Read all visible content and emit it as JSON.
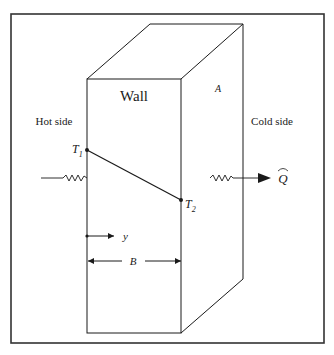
{
  "diagram": {
    "wall_label": "Wall",
    "area_label": "A",
    "hot_side_label": "Hot side",
    "cold_side_label": "Cold side",
    "t1": {
      "main": "T",
      "sub": "1"
    },
    "t2": {
      "main": "T",
      "sub": "2"
    },
    "heat_flow_label": "Q",
    "position_label": "y",
    "thickness_label": "B",
    "colors": {
      "line": "#1a1a1a",
      "frame": "#333333",
      "background": "#ffffff"
    }
  }
}
